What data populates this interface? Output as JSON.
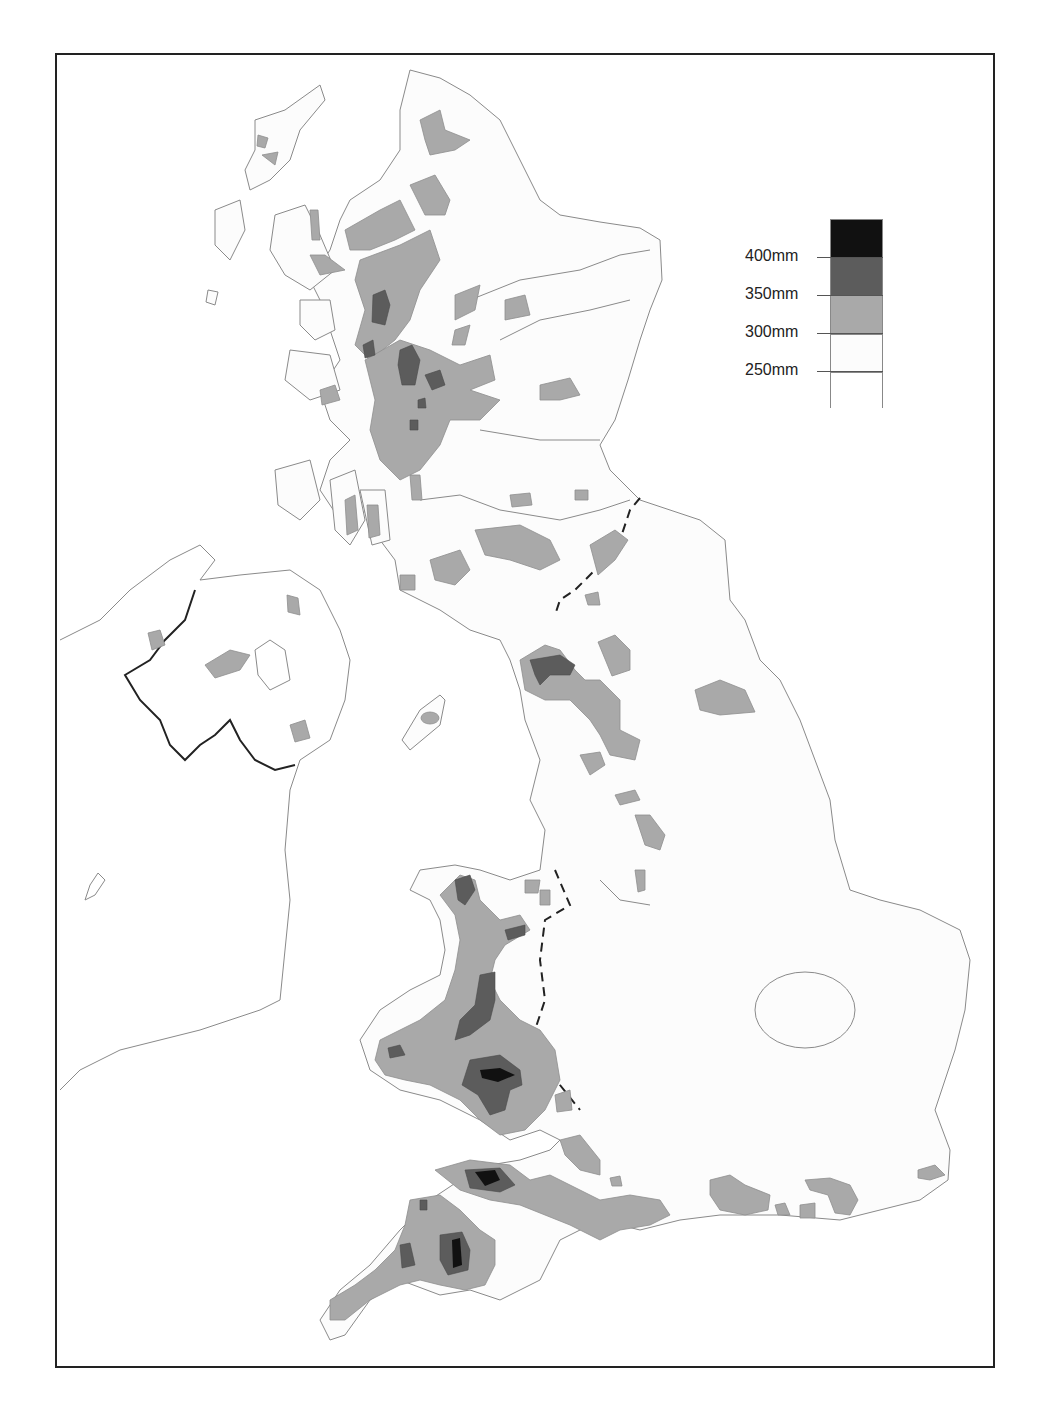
{
  "map": {
    "subject": "Rainfall contour map of the British Isles",
    "colors": {
      "above_400": "#111111",
      "350_400": "#5c5c5c",
      "300_350": "#a9a9a9",
      "250_300": "#fcfcfc",
      "below_250": "#ffffff",
      "coastline": "#8a8a8a",
      "border": "#222222",
      "frame": "#222222"
    }
  },
  "legend": {
    "labels": [
      "400mm",
      "350mm",
      "300mm",
      "250mm"
    ],
    "bands": [
      {
        "range": ">400mm",
        "color": "#111111"
      },
      {
        "range": "350–400mm",
        "color": "#5c5c5c"
      },
      {
        "range": "300–350mm",
        "color": "#a9a9a9"
      },
      {
        "range": "250–300mm",
        "color": "#fcfcfc"
      },
      {
        "range": "<250mm",
        "color": "#ffffff"
      }
    ]
  }
}
